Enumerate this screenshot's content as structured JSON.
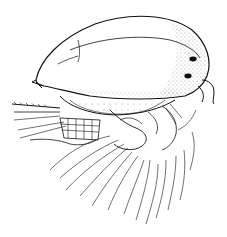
{
  "image": {
    "subject": "Line drawing of a small crustacean (ostracod-like) in lateral view",
    "background": "#ffffff",
    "ink": "#111111",
    "width": 227,
    "height": 237
  }
}
